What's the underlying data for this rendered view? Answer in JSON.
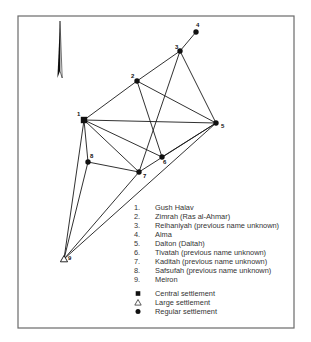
{
  "map": {
    "frame": {
      "x": 18,
      "y": 16,
      "width": 276,
      "height": 312
    },
    "north_arrow": {
      "icon": "north-arrow-icon",
      "x": 60,
      "top": 21,
      "bottom": 78
    },
    "colors": {
      "line": "#1a1a1a",
      "frame": "#6a6a6a",
      "text": "#333333"
    },
    "nodes": [
      {
        "id": "1",
        "x": 84,
        "y": 120,
        "type": "central",
        "label_dx": -7,
        "label_dy": -4
      },
      {
        "id": "2",
        "x": 137,
        "y": 81,
        "type": "regular",
        "label_dx": -6,
        "label_dy": -3
      },
      {
        "id": "3",
        "x": 180,
        "y": 51,
        "type": "regular",
        "label_dx": -5,
        "label_dy": -2
      },
      {
        "id": "4",
        "x": 196,
        "y": 32,
        "type": "regular",
        "label_dx": 0,
        "label_dy": -5
      },
      {
        "id": "5",
        "x": 216,
        "y": 123,
        "type": "regular",
        "label_dx": 5,
        "label_dy": 5
      },
      {
        "id": "6",
        "x": 162,
        "y": 157,
        "type": "regular",
        "label_dx": 1,
        "label_dy": 7
      },
      {
        "id": "7",
        "x": 139,
        "y": 172,
        "type": "regular",
        "label_dx": 4,
        "label_dy": 6
      },
      {
        "id": "8",
        "x": 88,
        "y": 162,
        "type": "regular",
        "label_dx": 2,
        "label_dy": -4
      },
      {
        "id": "9",
        "x": 64,
        "y": 259,
        "type": "large",
        "label_dx": 4,
        "label_dy": 1
      }
    ],
    "edges": [
      [
        "1",
        "2"
      ],
      [
        "2",
        "3"
      ],
      [
        "3",
        "4"
      ],
      [
        "1",
        "5"
      ],
      [
        "2",
        "5"
      ],
      [
        "3",
        "5"
      ],
      [
        "2",
        "6"
      ],
      [
        "3",
        "7"
      ],
      [
        "1",
        "6"
      ],
      [
        "1",
        "7"
      ],
      [
        "1",
        "8"
      ],
      [
        "8",
        "7"
      ],
      [
        "7",
        "5"
      ],
      [
        "6",
        "5"
      ],
      [
        "1",
        "9"
      ],
      [
        "8",
        "9"
      ],
      [
        "7",
        "9"
      ],
      [
        "5",
        "9"
      ]
    ]
  },
  "legend": {
    "settlements": [
      {
        "number": "1.",
        "name": "Gush Halav"
      },
      {
        "number": "2.",
        "name": "Zimrah (Ras al-Ahmar)"
      },
      {
        "number": "3.",
        "name": "Reihaniyah (previous name unknown)"
      },
      {
        "number": "4.",
        "name": "Alma"
      },
      {
        "number": "5.",
        "name": "Dalton (Daltah)"
      },
      {
        "number": "6.",
        "name": "Tivatah (previous name unknown)"
      },
      {
        "number": "7.",
        "name": "Kaditah (previous name unknown)"
      },
      {
        "number": "8.",
        "name": "Safsufah (previous name unknown)"
      },
      {
        "number": "9.",
        "name": "Meiron"
      }
    ],
    "symbols": [
      {
        "symbol": "square",
        "icon": "filled-square-icon",
        "label": "Central settlement"
      },
      {
        "symbol": "triangle",
        "icon": "open-triangle-icon",
        "label": "Large settlement"
      },
      {
        "symbol": "circle",
        "icon": "filled-circle-icon",
        "label": "Regular settlement"
      }
    ]
  }
}
